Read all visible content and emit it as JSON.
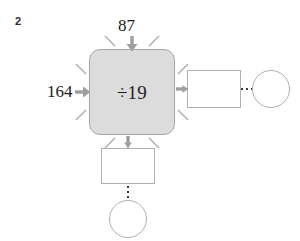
{
  "problem": {
    "number": "2"
  },
  "machine": {
    "operator_label": "÷19",
    "operator_symbol": "÷",
    "operator_value": "19",
    "fill_color": "#dcdcdc",
    "border_color": "#a6a6a6"
  },
  "inputs": [
    {
      "name": "top-input",
      "value": "87",
      "direction": "down"
    },
    {
      "name": "left-input",
      "value": "164",
      "direction": "right"
    }
  ],
  "outputs": [
    {
      "name": "right-output",
      "shape": "rectangle",
      "value": "",
      "direction": "right",
      "continuation": {
        "ellipsis": "⋯",
        "terminal_shape": "circle",
        "terminal_value": ""
      }
    },
    {
      "name": "bottom-output",
      "shape": "rectangle",
      "value": "",
      "direction": "down",
      "continuation": {
        "ellipsis": "⋮",
        "terminal_shape": "circle",
        "terminal_value": ""
      }
    }
  ],
  "style": {
    "arrow_color": "#9e9e9e",
    "tick_color": "#a8a8a8",
    "shape_border_color": "#b0b0b0",
    "text_color": "#1c1c1c",
    "background_color": "#ffffff"
  }
}
